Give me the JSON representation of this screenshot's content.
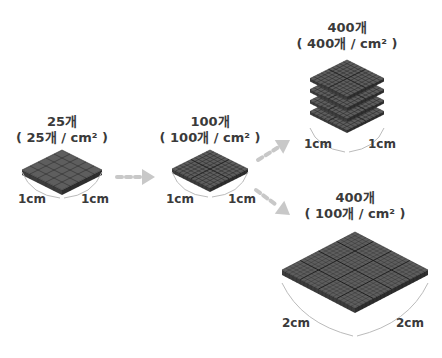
{
  "colors": {
    "tile_top": "#5e5e5e",
    "tile_side": "#3c3c3c",
    "grid_line": "#2a2a2a",
    "arrow": "#c8c8c8",
    "text": "#3a3a3a",
    "bracket": "#bbbbbb"
  },
  "stages": [
    {
      "title": "25개",
      "subtitle": "( 25개 / cm² )",
      "grid": 5,
      "left_dim": "1cm",
      "right_dim": "1cm"
    },
    {
      "title": "100개",
      "subtitle": "( 100개 / cm² )",
      "grid": 10,
      "left_dim": "1cm",
      "right_dim": "1cm"
    },
    {
      "title": "400개",
      "subtitle": "( 400개 / cm² )",
      "grid": 10,
      "layers": 4,
      "left_dim": "1cm",
      "right_dim": "1cm"
    },
    {
      "title": "400개",
      "subtitle": "( 100개 / cm² )",
      "grid": 20,
      "left_dim": "2cm",
      "right_dim": "2cm"
    }
  ],
  "arrows": [
    {
      "from": "stage-1",
      "to": "stage-2",
      "direction": "right"
    },
    {
      "from": "stage-2",
      "to": "stage-3",
      "direction": "up-right"
    },
    {
      "from": "stage-2",
      "to": "stage-4",
      "direction": "down-right"
    }
  ]
}
